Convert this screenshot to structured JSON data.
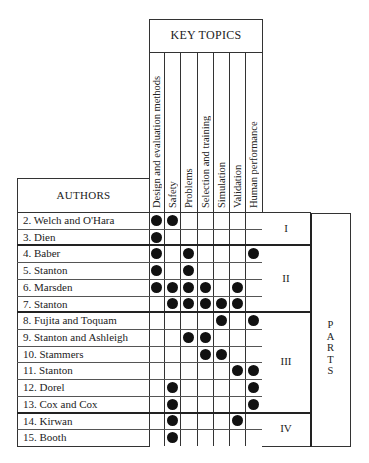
{
  "header": {
    "key_topics_title": "KEY TOPICS",
    "authors_title": "AUTHORS",
    "parts_title": [
      "P",
      "A",
      "R",
      "T",
      "S"
    ]
  },
  "topics": [
    "Design and evaluation methods",
    "Safety",
    "Problems",
    "Selection and training",
    "Simulation",
    "Validation",
    "Human performance"
  ],
  "authors": [
    {
      "label": "2.  Welch and O'Hara",
      "topics": [
        0,
        1
      ]
    },
    {
      "label": "3.  Dien",
      "topics": [
        0
      ]
    },
    {
      "label": "4.  Baber",
      "topics": [
        0,
        2,
        6
      ]
    },
    {
      "label": "5.  Stanton",
      "topics": [
        0,
        2
      ]
    },
    {
      "label": "6.  Marsden",
      "topics": [
        0,
        1,
        2,
        3,
        5
      ]
    },
    {
      "label": "7.  Stanton",
      "topics": [
        1,
        2,
        3,
        4,
        5
      ]
    },
    {
      "label": "8.  Fujita and Toquam",
      "topics": [
        4,
        6
      ]
    },
    {
      "label": "9.  Stanton and Ashleigh",
      "topics": [
        2,
        3
      ]
    },
    {
      "label": "10. Stammers",
      "topics": [
        3,
        4
      ]
    },
    {
      "label": "11. Stanton",
      "topics": [
        5,
        6
      ]
    },
    {
      "label": "12. Dorel",
      "topics": [
        1,
        6
      ]
    },
    {
      "label": "13. Cox and Cox",
      "topics": [
        1,
        6
      ]
    },
    {
      "label": "14. Kirwan",
      "topics": [
        1,
        5
      ]
    },
    {
      "label": "15. Booth",
      "topics": [
        1
      ]
    }
  ],
  "parts": [
    {
      "label": "I",
      "rows": [
        0,
        1
      ]
    },
    {
      "label": "II",
      "rows": [
        2,
        5
      ]
    },
    {
      "label": "III",
      "rows": [
        6,
        11
      ]
    },
    {
      "label": "IV",
      "rows": [
        12,
        13
      ]
    }
  ]
}
